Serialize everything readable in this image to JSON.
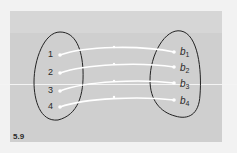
{
  "figure": {
    "label": "5.9",
    "domain_set": {
      "elements": [
        "1",
        "2",
        "3",
        "4"
      ]
    },
    "codomain_set": {
      "elements": [
        {
          "base": "b",
          "sub": "1"
        },
        {
          "base": "b",
          "sub": "2"
        },
        {
          "base": "b",
          "sub": "3"
        },
        {
          "base": "b",
          "sub": "4"
        }
      ]
    },
    "mapping": [
      [
        "1",
        "b1"
      ],
      [
        "2",
        "b2"
      ],
      [
        "3",
        "b3"
      ],
      [
        "4",
        "b4"
      ]
    ],
    "colors": {
      "panel": "#cfcfcf",
      "outline": "#222222",
      "arrow": "#ffffff"
    }
  }
}
